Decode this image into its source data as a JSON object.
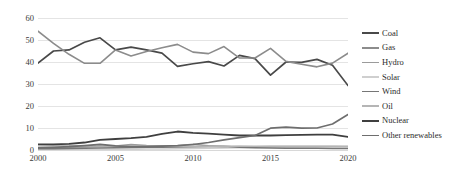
{
  "chart_data": {
    "type": "line",
    "title": "",
    "xlabel": "",
    "ylabel": "",
    "xlim": [
      2000,
      2020
    ],
    "ylim": [
      0,
      60
    ],
    "ytick_values": [
      0,
      10,
      20,
      30,
      40,
      50,
      60
    ],
    "ytick_labels": [
      "0",
      "10",
      "20",
      "30",
      "40",
      "50",
      "60"
    ],
    "xtick_values": [
      2000,
      2005,
      2010,
      2015,
      2020
    ],
    "xtick_labels": [
      "2000",
      "2005",
      "2010",
      "2015",
      "2020"
    ],
    "x": [
      2000,
      2001,
      2002,
      2003,
      2004,
      2005,
      2006,
      2007,
      2008,
      2009,
      2010,
      2011,
      2012,
      2013,
      2014,
      2015,
      2016,
      2017,
      2018,
      2019,
      2020
    ],
    "grid": true,
    "legend_position": "right",
    "series": [
      {
        "name": "Coal",
        "color": "#494949",
        "width": 1.7,
        "values": [
          39.5,
          45.0,
          45.5,
          49.0,
          51.0,
          45.5,
          46.8,
          45.5,
          44.0,
          38.0,
          39.2,
          40.2,
          38.2,
          43.0,
          41.5,
          34.0,
          40.0,
          39.8,
          41.2,
          38.5,
          29.3
        ]
      },
      {
        "name": "Gas",
        "color": "#8c8c8c",
        "width": 1.6,
        "values": [
          54.0,
          48.5,
          43.5,
          39.4,
          39.4,
          45.5,
          42.7,
          44.8,
          46.5,
          48.0,
          44.5,
          43.8,
          47.0,
          41.8,
          41.8,
          46.2,
          40.3,
          39.0,
          37.8,
          39.5,
          44.0
        ]
      },
      {
        "name": "Hydro",
        "color": "#9b9b9b",
        "width": 1.5,
        "values": [
          1.2,
          1.2,
          1.3,
          1.4,
          1.6,
          1.8,
          2.5,
          2.0,
          1.9,
          1.9,
          2.6,
          1.9,
          1.5,
          1.6,
          1.5,
          1.6,
          1.6,
          1.6,
          1.6,
          1.6,
          1.6
        ]
      },
      {
        "name": "Solar",
        "color": "#cfcfcf",
        "width": 1.5,
        "values": [
          0.2,
          0.2,
          0.2,
          0.2,
          0.2,
          0.3,
          0.3,
          0.4,
          0.5,
          0.6,
          0.7,
          0.8,
          0.9,
          1.0,
          1.1,
          1.2,
          1.3,
          1.4,
          1.5,
          1.5,
          1.6
        ]
      },
      {
        "name": "Wind",
        "color": "#767676",
        "width": 1.5,
        "values": [
          0.6,
          0.6,
          0.7,
          0.8,
          0.9,
          1.0,
          1.1,
          1.2,
          1.3,
          1.4,
          1.5,
          1.6,
          1.7,
          1.2,
          1.0,
          0.9,
          0.8,
          0.8,
          0.8,
          0.7,
          0.7
        ]
      },
      {
        "name": "Oil",
        "color": "#b5b5b5",
        "width": 1.5,
        "values": [
          2.4,
          2.2,
          2.0,
          1.9,
          1.8,
          1.8,
          1.7,
          1.7,
          1.7,
          1.7,
          1.7,
          1.7,
          1.7,
          1.7,
          1.7,
          1.7,
          1.7,
          1.7,
          1.7,
          1.7,
          1.6
        ]
      },
      {
        "name": "Nuclear",
        "color": "#3f3f3f",
        "width": 1.8,
        "values": [
          2.6,
          2.6,
          2.8,
          3.4,
          4.6,
          5.0,
          5.4,
          6.0,
          7.3,
          8.4,
          7.8,
          7.4,
          7.0,
          6.6,
          6.6,
          6.6,
          6.8,
          6.9,
          7.0,
          7.0,
          6.0
        ]
      },
      {
        "name": "Other renewables",
        "color": "#6e6e6e",
        "width": 1.7,
        "values": [
          1.0,
          1.2,
          1.5,
          2.0,
          2.6,
          1.9,
          1.5,
          1.5,
          1.8,
          2.0,
          2.5,
          3.4,
          4.6,
          5.6,
          6.6,
          9.9,
          10.4,
          9.9,
          10.0,
          11.8,
          16.1
        ]
      }
    ]
  }
}
